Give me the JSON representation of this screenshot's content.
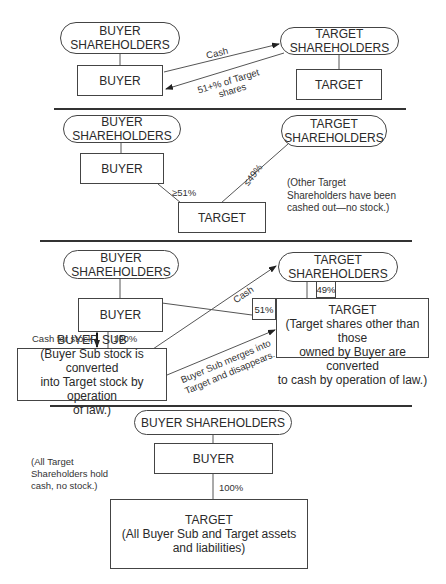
{
  "panels": [
    {
      "id": "panel-1",
      "nodes": {
        "buyer_shareholders": [
          "BUYER",
          "SHAREHOLDERS"
        ],
        "target_shareholders": [
          "TARGET",
          "SHAREHOLDERS"
        ],
        "buyer": "BUYER",
        "target": "TARGET"
      },
      "edges": {
        "cash": "Cash",
        "shares_line1": "51+% of Target",
        "shares_line2": "shares"
      }
    },
    {
      "id": "panel-2",
      "nodes": {
        "buyer_shareholders": [
          "BUYER",
          "SHAREHOLDERS"
        ],
        "target_shareholders": [
          "TARGET",
          "SHAREHOLDERS"
        ],
        "buyer": "BUYER",
        "target": "TARGET"
      },
      "edges": {
        "buyer_stake": "≥51%",
        "target_sh_stake": "≤49%"
      },
      "note": [
        "(Other Target",
        "Shareholders have been",
        "cashed out—no stock.)"
      ]
    },
    {
      "id": "panel-3",
      "nodes": {
        "buyer_shareholders": [
          "BUYER",
          "SHAREHOLDERS"
        ],
        "target_shareholders": [
          "TARGET",
          "SHAREHOLDERS"
        ],
        "buyer": "BUYER",
        "buyer_sub": [
          "BUYER SUB",
          "(Buyer Sub stock is converted",
          "into Target stock by operation",
          "of law.)"
        ],
        "target": [
          "TARGET",
          "(Target shares other than those",
          "owned by Buyer are converted",
          "to cash by operation of law.)"
        ]
      },
      "edges": {
        "cash": "Cash",
        "cash_for_stock": "Cash for stock",
        "sub_ownership": "100%",
        "buyer_stake": "51%",
        "target_sh_stake": "49%",
        "merge_line1": "Buyer Sub merges into",
        "merge_line2": "Target and disappears."
      }
    },
    {
      "id": "panel-4",
      "nodes": {
        "buyer_shareholders": "BUYER SHAREHOLDERS",
        "buyer": "BUYER",
        "target": [
          "TARGET",
          "(All Buyer Sub and Target assets",
          "and liabilities)"
        ]
      },
      "edges": {
        "ownership": "100%"
      },
      "note": [
        "(All Target",
        "Shareholders hold",
        "cash, no stock.)"
      ]
    }
  ],
  "colors": {
    "line": "#444444",
    "text": "#2a2a2a",
    "background": "#ffffff"
  }
}
